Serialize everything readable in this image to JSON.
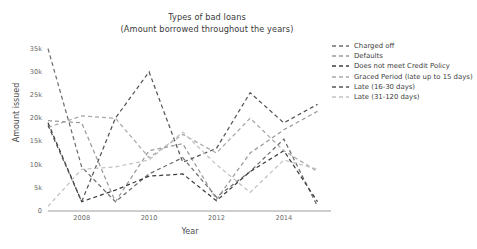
{
  "chart_data": {
    "type": "line",
    "title": "Types of bad loans",
    "subtitle": "(Amount borrowed throughout the years)",
    "xlabel": "Year",
    "ylabel": "Amount issued",
    "xlim": [
      2007,
      2015.4
    ],
    "ylim": [
      0,
      36000
    ],
    "xticks": [
      2008,
      2010,
      2012,
      2014
    ],
    "xticklabels": [
      "2008",
      "2010",
      "2012",
      "2014"
    ],
    "yticks": [
      0,
      5000,
      10000,
      15000,
      20000,
      25000,
      30000,
      35000
    ],
    "yticklabels": [
      "0",
      "5k",
      "10k",
      "15k",
      "20k",
      "25k",
      "30k",
      "35k"
    ],
    "grid": false,
    "legend_position": "upper right",
    "linestyle": "dashed",
    "x": [
      2007,
      2008,
      2009,
      2010,
      2011,
      2012,
      2013,
      2014,
      2015
    ],
    "series": [
      {
        "name": "Charged off",
        "color": "#6e6e6e",
        "values": [
          35000,
          9500,
          2000,
          8000,
          11500,
          3000,
          8500,
          15500,
          1000
        ]
      },
      {
        "name": "Defaults",
        "color": "#9a9a9a",
        "values": [
          19500,
          19000,
          2000,
          13000,
          14500,
          2500,
          12500,
          17500,
          21500
        ]
      },
      {
        "name": "Does not meet Credit Policy",
        "color": "#3c3c3c",
        "values": [
          19000,
          2000,
          4500,
          7500,
          8000,
          2200,
          8500,
          13000,
          2000
        ]
      },
      {
        "name": "Graced Period (late up to 15 days)",
        "color": "#a8a8a8",
        "values": [
          18000,
          20500,
          20000,
          11500,
          16500,
          12500,
          20000,
          13000,
          8500
        ]
      },
      {
        "name": "Late (16-30 days)",
        "color": "#555555",
        "values": [
          18500,
          2000,
          20000,
          30000,
          10500,
          13500,
          25500,
          19000,
          23000
        ]
      },
      {
        "name": "Late (31-120 days)",
        "color": "#c2c2c2",
        "values": [
          1000,
          9000,
          9500,
          11000,
          17000,
          10000,
          4000,
          11000,
          9000
        ]
      }
    ]
  }
}
